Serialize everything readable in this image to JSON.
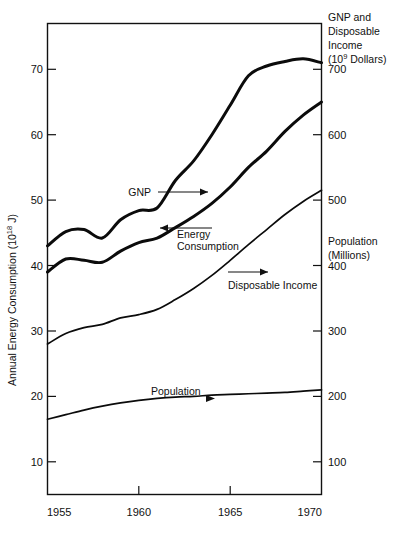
{
  "chart_data": {
    "type": "line",
    "title": "",
    "xlabel": "",
    "x": [
      1955,
      1956,
      1957,
      1958,
      1959,
      1960,
      1961,
      1962,
      1963,
      1964,
      1965,
      1966,
      1967,
      1968,
      1969,
      1970
    ],
    "xlim": [
      1955,
      1970
    ],
    "xticks": [
      1955,
      1960,
      1965,
      1970
    ],
    "xticklabels": [
      "1955",
      "1960",
      "1965",
      "1970"
    ],
    "grid": false,
    "legend_position": "inline-annotations",
    "left_axis": {
      "label": "Annual Energy Consumption (10¹⁸ J)",
      "label_text": "Annual Energy Consumption (10",
      "label_exponent": "18",
      "label_tail": " J)",
      "ylim": [
        5,
        77
      ],
      "ticks": [
        10,
        20,
        30,
        40,
        50,
        60,
        70
      ],
      "ticklabels": [
        "10",
        "20",
        "30",
        "40",
        "50",
        "60",
        "70"
      ]
    },
    "right_axis": {
      "label_top_line1": "GNP and",
      "label_top_line2": "Disposable",
      "label_top_line3": "Income",
      "label_top_line4_pre": "(10",
      "label_top_line4_sup": "9",
      "label_top_line4_post": " Dollars)",
      "label_mid_line1": "Population",
      "label_mid_line2": "(Millions)",
      "ylim": [
        50,
        770
      ],
      "ticks": [
        100,
        200,
        300,
        400,
        500,
        600,
        700
      ],
      "ticklabels": [
        "100",
        "200",
        "300",
        "400",
        "500",
        "600",
        "700"
      ]
    },
    "series": [
      {
        "name": "GNP",
        "axis": "right",
        "unit": "10^9 Dollars",
        "annotation": "GNP",
        "arrow_direction": "right",
        "values": [
          430,
          452,
          455,
          442,
          470,
          484,
          488,
          530,
          560,
          600,
          645,
          690,
          705,
          712,
          716,
          710
        ]
      },
      {
        "name": "Energy Consumption",
        "axis": "left",
        "unit": "10^18 J",
        "annotation": "Energy Consumption",
        "arrow_direction": "left",
        "values": [
          39.0,
          41.0,
          40.8,
          40.5,
          42.2,
          43.5,
          44.2,
          45.8,
          47.5,
          49.5,
          52.0,
          55.0,
          57.5,
          60.5,
          63.0,
          65.0
        ]
      },
      {
        "name": "Disposable Income",
        "axis": "right",
        "unit": "10^9 Dollars",
        "annotation": "Disposable Income",
        "arrow_direction": "right",
        "values": [
          280,
          296,
          305,
          310,
          320,
          325,
          333,
          348,
          365,
          385,
          408,
          432,
          455,
          478,
          498,
          515
        ]
      },
      {
        "name": "Population",
        "axis": "right",
        "unit": "Millions",
        "annotation": "Population",
        "arrow_direction": "right",
        "values": [
          165,
          172,
          179,
          185,
          190,
          194,
          197,
          199,
          200,
          202,
          203,
          204,
          205,
          206,
          208,
          210
        ]
      }
    ],
    "annotations": [
      {
        "text": "GNP",
        "arrow": "right"
      },
      {
        "text": "Energy Consumption",
        "arrow": "left"
      },
      {
        "text": "Disposable Income",
        "arrow": "right"
      },
      {
        "text": "Population",
        "arrow": "right"
      }
    ]
  }
}
